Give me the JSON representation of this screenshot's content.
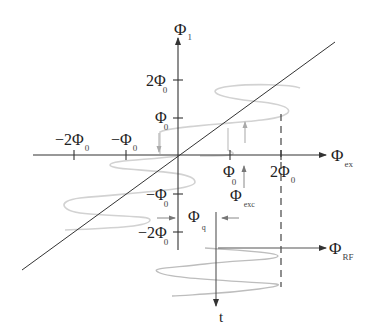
{
  "diagram": {
    "type": "rf-squid-flux-transfer-diagram",
    "colors": {
      "axis": "#333333",
      "diagonal": "#333333",
      "curve": "#cfcfcf",
      "arrow_gray": "#999999",
      "dashed": "#333333"
    },
    "axes": {
      "horizontal": {
        "symbol": "Φ",
        "subscript": "ex"
      },
      "vertical": {
        "symbol": "Φ",
        "subscript": "1"
      },
      "time": {
        "label": "t"
      },
      "rf": {
        "symbol": "Φ",
        "subscript": "RF"
      }
    },
    "x_ticks": [
      {
        "prefix": "−2Φ",
        "subscript": "0"
      },
      {
        "prefix": "−Φ",
        "subscript": "0"
      },
      {
        "prefix": "Φ",
        "subscript": "0"
      },
      {
        "prefix": "2Φ",
        "subscript": "0"
      }
    ],
    "y_ticks": [
      {
        "prefix": "2Φ",
        "subscript": "0"
      },
      {
        "prefix": "Φ",
        "subscript": "0"
      },
      {
        "prefix": "−Φ",
        "subscript": "0"
      },
      {
        "prefix": "−2Φ",
        "subscript": "0"
      }
    ],
    "annotations": {
      "exc": {
        "symbol": "Φ",
        "subscript": "exc"
      },
      "q": {
        "symbol": "Φ",
        "subscript": "q"
      }
    }
  }
}
